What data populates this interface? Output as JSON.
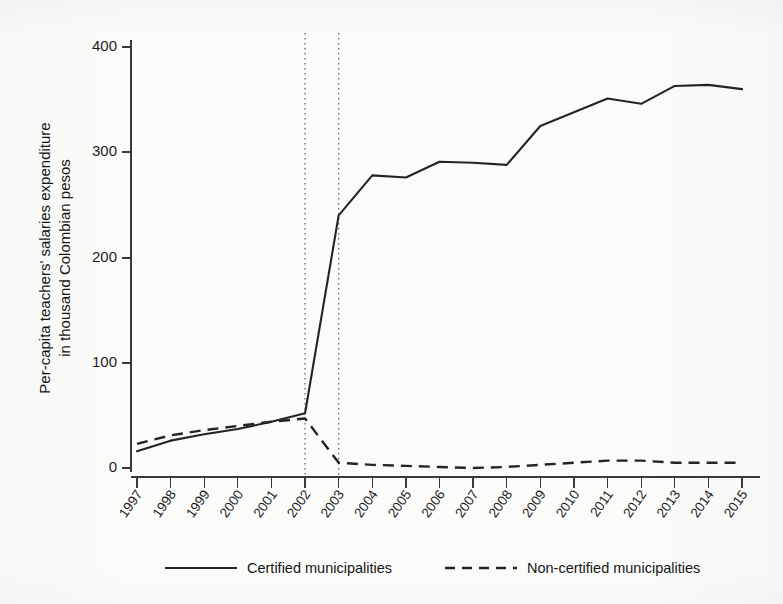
{
  "chart_data": {
    "type": "line",
    "title": "",
    "subtitle": "",
    "xlabel": "",
    "ylabel": "Per-capita teachers' salaries expenditure in thousand Colombian pesos",
    "ylabel_lines": [
      "Per-capita teachers' salaries expenditure",
      "in thousand Colombian pesos"
    ],
    "x": [
      1997,
      1998,
      1999,
      2000,
      2001,
      2002,
      2003,
      2004,
      2005,
      2006,
      2007,
      2008,
      2009,
      2010,
      2011,
      2012,
      2013,
      2014,
      2015
    ],
    "categories": [
      "1997",
      "1998",
      "1999",
      "2000",
      "2001",
      "2002",
      "2003",
      "2004",
      "2005",
      "2006",
      "2007",
      "2008",
      "2009",
      "2010",
      "2011",
      "2012",
      "2013",
      "2014",
      "2015"
    ],
    "series": [
      {
        "name": "Certified municipalities",
        "style": "solid",
        "color": "#242424",
        "values": [
          16,
          26,
          32,
          37,
          44,
          52,
          240,
          278,
          276,
          291,
          290,
          288,
          325,
          338,
          351,
          346,
          363,
          364,
          360
        ]
      },
      {
        "name": "Non-certified municipalities",
        "style": "dashed",
        "color": "#242424",
        "values": [
          23,
          31,
          36,
          40,
          44,
          47,
          5,
          3,
          2,
          1,
          0,
          1,
          3,
          5,
          7,
          7,
          5,
          5,
          5
        ]
      }
    ],
    "ylim": [
      0,
      410
    ],
    "yticks": [
      0,
      100,
      200,
      300,
      400
    ],
    "ytick_labels": [
      "0",
      "100",
      "200",
      "300",
      "400"
    ],
    "xlim": [
      1997,
      2015
    ],
    "grid": false,
    "legend_position": "bottom",
    "annotations": [
      {
        "type": "vertical-reference-line",
        "x": 2002,
        "style": "dotted"
      },
      {
        "type": "vertical-reference-line",
        "x": 2003,
        "style": "dotted"
      }
    ]
  },
  "legend": {
    "entries": [
      {
        "label": "Certified municipalities",
        "style": "solid"
      },
      {
        "label": "Non-certified municipalities",
        "style": "dashed"
      }
    ]
  }
}
